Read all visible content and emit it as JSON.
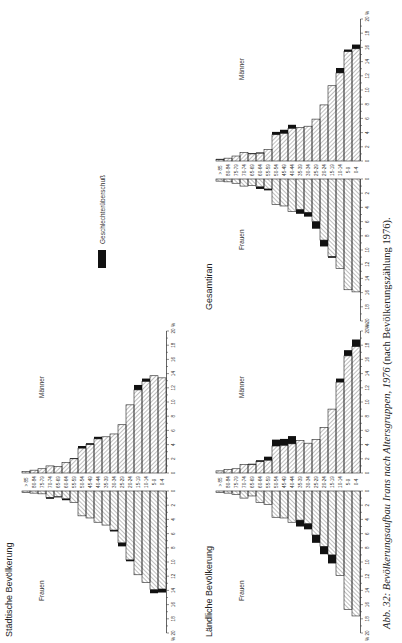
{
  "page": {
    "orientation": "rotated-90-ccw",
    "caption_italic": "Abb. 32: Bevölkerungsaufbau Irans nach Altersgruppen, 1976",
    "caption_upright": " (nach Bevölkerungszählung 1976)."
  },
  "legend": {
    "label": "Geschlechterüberschuß",
    "color": "#111111"
  },
  "labels": {
    "women": "Frauen",
    "men": "Männer",
    "percent": "%"
  },
  "chart_data": [
    {
      "type": "bar",
      "subtype": "population-pyramid",
      "title": "Städtische Bevölkerung",
      "xlabel": "%",
      "xlim": [
        0,
        20
      ],
      "xticks": [
        0,
        2,
        4,
        6,
        8,
        10,
        12,
        14,
        16,
        18,
        20
      ],
      "categories": [
        "0-4",
        "5-9",
        "10-14",
        "15-19",
        "20-24",
        "25-29",
        "30-34",
        "35-39",
        "40-44",
        "45-49",
        "50-54",
        "55-59",
        "60-64",
        "65-69",
        "70-74",
        "75-79",
        "80-84",
        "> 85"
      ],
      "series": [
        {
          "name": "Frauen",
          "values": [
            13.8,
            13.9,
            12.9,
            11.8,
            9.7,
            7.3,
            5.5,
            4.8,
            4.4,
            3.8,
            3.5,
            1.6,
            1.1,
            0.8,
            0.9,
            0.4,
            0.3,
            0.2
          ]
        },
        {
          "name": "Frauen Überschuß",
          "values": [
            0.5,
            0.5,
            0.0,
            0.0,
            0.2,
            0.5,
            0.2,
            0.0,
            0.0,
            0.0,
            0.0,
            0.0,
            0.2,
            0.1,
            0.2,
            0.0,
            0.0,
            0.0
          ]
        },
        {
          "name": "Männer",
          "values": [
            13.4,
            13.7,
            12.9,
            11.7,
            9.6,
            6.8,
            5.5,
            5.1,
            4.8,
            4.0,
            3.5,
            2.0,
            1.5,
            0.9,
            1.0,
            0.6,
            0.4,
            0.2
          ]
        },
        {
          "name": "Männer Überschuß",
          "values": [
            0.0,
            0.0,
            0.4,
            0.7,
            0.0,
            0.0,
            0.0,
            0.0,
            0.3,
            0.2,
            0.3,
            0.1,
            0.0,
            0.0,
            0.0,
            0.0,
            0.0,
            0.0
          ]
        }
      ],
      "legend": [
        "Geschlechterüberschuß"
      ],
      "grid": false
    },
    {
      "type": "bar",
      "subtype": "population-pyramid",
      "title": "Ländliche Bevölkerung",
      "xlabel": "%",
      "xlim": [
        0,
        20
      ],
      "xticks": [
        0,
        2,
        4,
        6,
        8,
        10,
        12,
        14,
        16,
        18,
        20
      ],
      "categories": [
        "0-4",
        "5-9",
        "10-14",
        "15-19",
        "20-24",
        "25-29",
        "30-34",
        "35-39",
        "40-44",
        "45-49",
        "50-54",
        "55-59",
        "60-64",
        "65-69",
        "70-74",
        "75-79",
        "80-84",
        "> 85"
      ],
      "series": [
        {
          "name": "Frauen",
          "values": [
            17.6,
            16.7,
            11.9,
            9.0,
            7.8,
            6.2,
            4.6,
            4.1,
            4.4,
            3.8,
            3.7,
            1.9,
            1.6,
            0.7,
            1.0,
            0.5,
            0.3,
            0.2
          ]
        },
        {
          "name": "Frauen Überschuß",
          "values": [
            0.0,
            0.0,
            0.0,
            1.2,
            1.1,
            1.1,
            0.8,
            0.9,
            0.0,
            0.0,
            0.0,
            0.0,
            0.0,
            0.0,
            0.0,
            0.0,
            0.0,
            0.0
          ]
        },
        {
          "name": "Männer",
          "values": [
            17.8,
            16.5,
            12.8,
            9.0,
            6.4,
            4.7,
            4.2,
            4.6,
            4.1,
            3.9,
            3.8,
            1.8,
            1.6,
            1.2,
            1.2,
            0.6,
            0.5,
            0.3
          ]
        },
        {
          "name": "Männer Überschuß",
          "values": [
            1.0,
            0.8,
            0.5,
            0.0,
            0.0,
            0.0,
            0.0,
            0.0,
            1.1,
            0.9,
            0.9,
            0.5,
            0.2,
            0.1,
            0.0,
            0.0,
            0.0,
            0.0
          ]
        }
      ],
      "legend": [
        "Geschlechterüberschuß"
      ],
      "grid": false
    },
    {
      "type": "bar",
      "subtype": "population-pyramid",
      "title": "Gesamtiran",
      "xlabel": "%",
      "xlim": [
        0,
        20
      ],
      "xticks": [
        0,
        2,
        4,
        6,
        8,
        10,
        12,
        14,
        16,
        18,
        20
      ],
      "categories": [
        "0-4",
        "5-9",
        "10-14",
        "15-19",
        "20-24",
        "25-29",
        "30-34",
        "35-39",
        "40-44",
        "45-49",
        "50-54",
        "55-59",
        "60-64",
        "65-69",
        "70-74",
        "75-79",
        "80-84",
        "> 85"
      ],
      "series": [
        {
          "name": "Frauen",
          "values": [
            15.9,
            15.6,
            12.6,
            10.9,
            8.6,
            6.0,
            4.7,
            4.3,
            4.6,
            3.8,
            3.6,
            1.4,
            1.1,
            0.9,
            1.0,
            0.6,
            0.4,
            0.3
          ]
        },
        {
          "name": "Frauen Überschuß",
          "values": [
            0.0,
            0.0,
            0.0,
            0.2,
            0.9,
            1.0,
            0.6,
            0.6,
            0.0,
            0.0,
            0.0,
            0.2,
            0.3,
            0.0,
            0.0,
            0.0,
            0.0,
            0.0
          ]
        },
        {
          "name": "Männer",
          "values": [
            15.8,
            15.4,
            12.4,
            10.6,
            7.9,
            5.9,
            4.9,
            4.7,
            4.6,
            3.9,
            3.7,
            1.6,
            1.1,
            1.0,
            1.2,
            0.7,
            0.4,
            0.2
          ]
        },
        {
          "name": "Männer Überschuß",
          "values": [
            0.6,
            0.3,
            0.7,
            0.0,
            0.0,
            0.0,
            0.0,
            0.0,
            0.5,
            0.5,
            0.4,
            0.0,
            0.1,
            0.1,
            0.0,
            0.0,
            0.0,
            0.1
          ]
        }
      ],
      "legend": [
        "Geschlechterüberschuß"
      ],
      "grid": false
    }
  ]
}
